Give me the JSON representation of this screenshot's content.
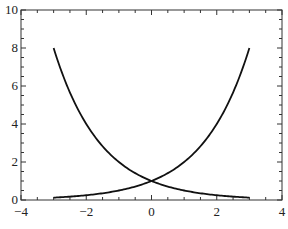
{
  "chart_data": {
    "type": "line",
    "title": "",
    "xlabel": "",
    "ylabel": "",
    "xlim": [
      -4,
      4
    ],
    "ylim": [
      0,
      10
    ],
    "grid": false,
    "legend": null,
    "x_ticks": [
      -4,
      -2,
      0,
      2,
      4
    ],
    "x_tick_labels": [
      "−4",
      "−2",
      "0",
      "2",
      "4"
    ],
    "y_ticks": [
      0,
      2,
      4,
      6,
      8,
      10
    ],
    "y_tick_labels": [
      "0",
      "2",
      "4",
      "6",
      "8",
      "10"
    ],
    "series": [
      {
        "name": "y = 2^(-x)",
        "x": [
          -3,
          -2.5,
          -2,
          -1.5,
          -1,
          -0.5,
          0,
          0.5,
          1,
          1.5,
          2,
          2.5,
          3
        ],
        "y": [
          8,
          5.66,
          4,
          2.83,
          2,
          1.41,
          1,
          0.71,
          0.5,
          0.35,
          0.25,
          0.18,
          0.125
        ],
        "color": "#111111"
      },
      {
        "name": "y = 2^x",
        "x": [
          -3,
          -2.5,
          -2,
          -1.5,
          -1,
          -0.5,
          0,
          0.5,
          1,
          1.5,
          2,
          2.5,
          3
        ],
        "y": [
          0.125,
          0.18,
          0.25,
          0.35,
          0.5,
          0.71,
          1,
          1.41,
          2,
          2.83,
          4,
          5.66,
          8
        ],
        "color": "#111111"
      }
    ],
    "annotations": [
      "curves intersect at (0, 1)"
    ]
  },
  "plot": {
    "left": 21,
    "right": 282,
    "top": 10,
    "bottom": 200,
    "axis_color": "#333333",
    "line_width": 1.8
  }
}
